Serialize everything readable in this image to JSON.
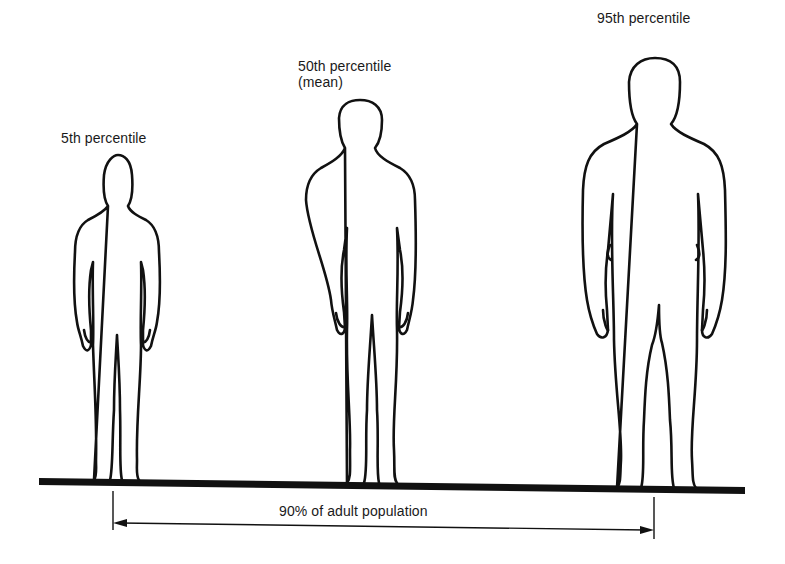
{
  "figures": [
    {
      "id": "p5",
      "label_line1": "5th percentile",
      "label_line2": ""
    },
    {
      "id": "p50",
      "label_line1": "50th percentile",
      "label_line2": "(mean)"
    },
    {
      "id": "p95",
      "label_line1": "95th percentile",
      "label_line2": ""
    }
  ],
  "range": {
    "label": "90% of adult population"
  },
  "colors": {
    "ink": "#111111",
    "background": "#ffffff"
  }
}
